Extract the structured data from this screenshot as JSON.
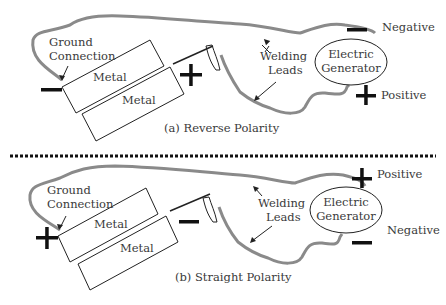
{
  "panels": [
    {
      "caption": "(a) Reverse Polarity",
      "ground_label_1": "Ground",
      "ground_label_2": "Connection",
      "metal_top": "Metal",
      "metal_bottom": "Metal",
      "welding_1": "Welding",
      "welding_2": "Leads",
      "generator_1": "Electric",
      "generator_2": "Generator",
      "top_terminal_label": "Negative",
      "bottom_terminal_label": "Positive",
      "ground_sign": "minus",
      "electrode_sign": "plus"
    },
    {
      "caption": "(b) Straight Polarity",
      "ground_label_1": "Ground",
      "ground_label_2": "Connection",
      "metal_top": "Metal",
      "metal_bottom": "Metal",
      "welding_1": "Welding",
      "welding_2": "Leads",
      "generator_1": "Electric",
      "generator_2": "Generator",
      "top_terminal_label": "Positive",
      "bottom_terminal_label": "Negative",
      "ground_sign": "plus",
      "electrode_sign": "minus"
    }
  ],
  "colors": {
    "lead": "#8a8a8a",
    "line": "#222222",
    "sign": "#111111"
  }
}
